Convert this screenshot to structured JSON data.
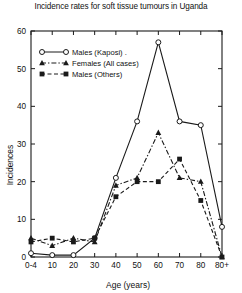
{
  "chart_data": {
    "type": "line",
    "title": "Incidence rates for soft tissue tumours in Uganda",
    "xlabel": "Age (years)",
    "ylabel": "Incidences",
    "categories": [
      "0-4",
      "10",
      "20",
      "30",
      "40",
      "50",
      "60",
      "70",
      "80",
      "80+"
    ],
    "xtick_labels": [
      "0-4",
      "10",
      "20",
      "30",
      "40",
      "50",
      "60",
      "70",
      "80",
      "80+"
    ],
    "ytick_labels": [
      "0",
      "10",
      "20",
      "30",
      "40",
      "50",
      "60"
    ],
    "ylim": [
      0,
      60
    ],
    "ytick_values": [
      0,
      10,
      20,
      30,
      40,
      50,
      60
    ],
    "grid": false,
    "legend_position": "upper-left",
    "series": [
      {
        "name": "Males (Kaposi)",
        "marker": "open-circle",
        "linestyle": "solid",
        "values": [
          1,
          0.5,
          0.5,
          5,
          21,
          36,
          57,
          36,
          35,
          8
        ]
      },
      {
        "name": "Females (All cases)",
        "marker": "filled-triangle",
        "linestyle": "dash-dot",
        "values": [
          5,
          3,
          5,
          4,
          19,
          21,
          33,
          21,
          20,
          0
        ]
      },
      {
        "name": "Males (Others)",
        "marker": "filled-square",
        "linestyle": "dashed",
        "values": [
          4,
          5,
          4,
          5,
          16,
          20,
          20,
          26,
          15,
          0
        ]
      }
    ]
  },
  "legend": {
    "entries": [
      {
        "label": "Males (Kaposi) ."
      },
      {
        "label": "Females (All cases)"
      },
      {
        "label": "Males (Others)"
      }
    ]
  },
  "colors": {
    "ink": "#1a1a1a",
    "background": "#ffffff"
  }
}
